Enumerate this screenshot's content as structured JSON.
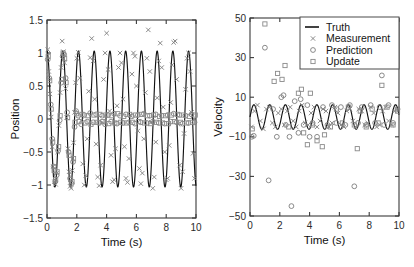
{
  "figure": {
    "background": "#ffffff",
    "truth_color": "#121212",
    "marker_color": "#7d7d7d"
  },
  "legend": {
    "position": "top-right-of-right-panel",
    "entries": [
      {
        "label": "Truth",
        "marker": "line"
      },
      {
        "label": "Measurement",
        "marker": "x"
      },
      {
        "label": "Prediction",
        "marker": "circle"
      },
      {
        "label": "Update",
        "marker": "square"
      }
    ]
  },
  "chart_data": [
    {
      "type": "line",
      "id": "position-panel",
      "title": "",
      "xlabel": "Time (s)",
      "ylabel": "Position",
      "xlim": [
        0,
        10
      ],
      "ylim": [
        -1.5,
        1.5
      ],
      "xticks": [
        0,
        2,
        4,
        6,
        8,
        10
      ],
      "yticks": [
        -1.5,
        -1,
        -0.5,
        0,
        0.5,
        1,
        1.5
      ],
      "xticklabels": [
        "0",
        "2",
        "4",
        "6",
        "8",
        "10"
      ],
      "yticklabels": [
        "-1.5",
        "-1",
        "-0.5",
        "0",
        "0.5",
        "1",
        "1.5"
      ],
      "grid": false,
      "series": [
        {
          "name": "Truth",
          "marker": "line",
          "type": "sinusoid",
          "amplitude": 1.03,
          "omega": 5.95,
          "phase": 1.5708,
          "samples": 900
        },
        {
          "name": "Measurement",
          "marker": "x",
          "x": [
            0.05,
            0.12,
            0.2,
            0.28,
            0.35,
            0.42,
            0.5,
            0.58,
            0.65,
            0.72,
            0.8,
            0.88,
            0.95,
            1.02,
            1.1,
            1.18,
            1.25,
            1.32,
            1.4,
            1.48,
            1.55,
            1.62,
            1.7,
            1.78,
            1.85,
            1.92,
            2.0,
            2.1,
            2.2,
            2.3,
            2.4,
            2.5,
            2.6,
            2.7,
            2.8,
            2.9,
            3.0,
            3.1,
            3.2,
            3.3,
            3.4,
            3.5,
            3.6,
            3.7,
            3.8,
            3.9,
            4.0,
            4.1,
            4.2,
            4.3,
            4.4,
            4.5,
            4.6,
            4.7,
            4.8,
            4.9,
            5.0,
            5.1,
            5.2,
            5.3,
            5.4,
            5.5,
            5.6,
            5.7,
            5.8,
            5.9,
            6.0,
            6.1,
            6.2,
            6.3,
            6.4,
            6.5,
            6.6,
            6.7,
            6.8,
            6.9,
            7.0,
            7.1,
            7.2,
            7.3,
            7.4,
            7.5,
            7.6,
            7.7,
            7.8,
            7.9,
            8.0,
            8.1,
            8.2,
            8.3,
            8.4,
            8.5,
            8.6,
            8.7,
            8.8,
            8.9,
            9.0,
            9.1,
            9.2,
            9.3,
            9.4,
            9.5,
            9.6,
            9.7,
            9.8,
            9.9
          ],
          "y": [
            1.05,
            0.72,
            0.38,
            0.03,
            -0.42,
            -0.72,
            -0.95,
            -0.99,
            -0.82,
            -0.5,
            -0.1,
            0.4,
            0.78,
            1.18,
            1.02,
            0.85,
            0.46,
            0.02,
            -0.45,
            -0.8,
            -1.02,
            -1.05,
            -0.78,
            -0.36,
            0.1,
            0.55,
            0.92,
            1.01,
            0.62,
            -0.02,
            -0.68,
            -1.0,
            -0.86,
            -0.3,
            0.42,
            0.93,
            1.22,
            0.88,
            0.3,
            -0.38,
            -0.88,
            -1.01,
            -0.7,
            -0.05,
            0.6,
            1.0,
            1.3,
            0.75,
            0.12,
            -0.55,
            -0.95,
            -0.92,
            -0.45,
            0.2,
            0.78,
            1.0,
            0.85,
            0.3,
            -0.42,
            -0.9,
            -0.96,
            -0.6,
            0.05,
            0.68,
            1.0,
            0.95,
            0.5,
            -0.18,
            -0.75,
            -0.98,
            -0.82,
            -0.3,
            0.4,
            0.92,
            1.35,
            0.72,
            -0.05,
            -1.05,
            -0.88,
            -0.35,
            0.32,
            0.88,
            1.15,
            0.78,
            0.18,
            -0.5,
            -0.92,
            -0.9,
            -0.4,
            0.25,
            0.82,
            1.16,
            1.18,
            0.6,
            -0.08,
            -0.7,
            -1.05,
            -0.8,
            -0.22,
            0.45,
            0.92,
            1.0,
            0.72,
            0.1,
            -0.52,
            -0.9,
            -0.78,
            -0.2,
            0.58
          ]
        },
        {
          "name": "Prediction",
          "marker": "circle",
          "x": [
            0.05,
            0.15,
            0.25,
            0.35,
            0.45,
            0.55,
            0.65,
            0.75,
            0.85,
            0.95,
            1.05,
            1.15,
            1.25,
            1.35,
            1.45,
            1.55,
            1.65,
            1.75,
            1.85,
            1.95,
            2.1,
            2.3,
            2.5,
            2.7,
            2.9,
            3.1,
            3.3,
            3.5,
            3.7,
            3.9,
            4.1,
            4.3,
            4.5,
            4.7,
            4.9,
            5.1,
            5.3,
            5.5,
            5.7,
            5.9,
            6.1,
            6.3,
            6.5,
            6.7,
            6.9,
            7.1,
            7.3,
            7.5,
            7.7,
            7.9,
            8.1,
            8.3,
            8.5,
            8.7,
            8.9,
            9.1,
            9.3,
            9.5,
            9.7,
            9.9
          ],
          "y": [
            0.9,
            0.62,
            0.22,
            -0.3,
            -0.72,
            -0.95,
            -0.85,
            -0.48,
            -0.02,
            0.55,
            0.95,
            0.98,
            0.62,
            0.1,
            -0.5,
            -0.9,
            -0.98,
            -0.65,
            -0.12,
            0.12,
            0.05,
            -0.08,
            0.06,
            -0.04,
            0.09,
            -0.05,
            0.07,
            -0.06,
            0.05,
            -0.08,
            0.06,
            -0.04,
            0.08,
            -0.07,
            0.05,
            -0.06,
            0.07,
            -0.05,
            0.04,
            -0.07,
            0.06,
            -0.05,
            0.08,
            -0.06,
            0.05,
            -0.04,
            0.07,
            -0.06,
            0.05,
            -0.07,
            0.06,
            -0.04,
            0.08,
            -0.05,
            0.06,
            -0.07,
            0.05,
            -0.06,
            0.07,
            -0.05
          ]
        },
        {
          "name": "Update",
          "marker": "square",
          "x": [
            0.08,
            0.18,
            0.28,
            0.38,
            0.48,
            0.58,
            0.68,
            0.78,
            0.88,
            0.98,
            1.08,
            1.18,
            1.28,
            1.38,
            1.48,
            1.58,
            1.68,
            1.78,
            1.88,
            1.98,
            2.15,
            2.35,
            2.55,
            2.75,
            2.95,
            3.15,
            3.35,
            3.55,
            3.75,
            3.95,
            4.15,
            4.35,
            4.55,
            4.75,
            4.95,
            5.15,
            5.35,
            5.55,
            5.75,
            5.95,
            6.15,
            6.35,
            6.55,
            6.75,
            6.95,
            7.15,
            7.35,
            7.55,
            7.75,
            7.95,
            8.15,
            8.35,
            8.55,
            8.75,
            8.95,
            9.15,
            9.35,
            9.55,
            9.75,
            9.95
          ],
          "y": [
            0.95,
            0.58,
            0.15,
            -0.35,
            -0.78,
            -0.92,
            -0.8,
            -0.42,
            0.05,
            0.6,
            1.0,
            0.92,
            0.55,
            0.02,
            -0.55,
            -0.92,
            -0.95,
            -0.6,
            -0.05,
            0.08,
            -0.04,
            0.07,
            -0.06,
            0.05,
            -0.08,
            0.06,
            -0.05,
            0.07,
            -0.04,
            0.06,
            -0.07,
            0.05,
            -0.06,
            0.08,
            -0.05,
            0.04,
            -0.06,
            0.07,
            -0.05,
            0.06,
            -0.04,
            0.07,
            -0.06,
            0.05,
            -0.07,
            0.06,
            -0.05,
            0.04,
            -0.06,
            0.05,
            -0.07,
            0.06,
            -0.04,
            0.07,
            -0.05,
            0.06,
            -0.06,
            0.04,
            -0.05,
            0.06
          ]
        }
      ]
    },
    {
      "type": "line",
      "id": "velocity-panel",
      "title": "",
      "xlabel": "Time (s)",
      "ylabel": "Velocity",
      "xlim": [
        0,
        10
      ],
      "ylim": [
        -50,
        50
      ],
      "xticks": [
        0,
        2,
        4,
        6,
        8,
        10
      ],
      "yticks": [
        -50,
        -30,
        -10,
        10,
        30,
        50
      ],
      "xticklabels": [
        "0",
        "2",
        "4",
        "6",
        "8",
        "10"
      ],
      "yticklabels": [
        "-50",
        "-30",
        "-10",
        "10",
        "30",
        "50"
      ],
      "grid": false,
      "series": [
        {
          "name": "Truth",
          "marker": "line",
          "type": "sinusoid",
          "amplitude": 6.2,
          "omega": 5.95,
          "phase": 0,
          "samples": 900
        },
        {
          "name": "Measurement",
          "marker": "x",
          "x": [
            0.1,
            0.3,
            0.5,
            0.7,
            0.9,
            1.1,
            1.3,
            1.5,
            1.7,
            1.9,
            2.1,
            2.3,
            2.5,
            2.7,
            2.9,
            3.1,
            3.3,
            3.5,
            3.7,
            3.9,
            4.1,
            4.3,
            4.5,
            4.7,
            4.9,
            5.1,
            5.3,
            5.5,
            5.7,
            5.9,
            6.1,
            6.3,
            6.5,
            6.7,
            6.9,
            7.1,
            7.3,
            7.5,
            7.7,
            7.9,
            8.1,
            8.3,
            8.5,
            8.7,
            8.9,
            9.1,
            9.3,
            9.5,
            9.7,
            9.9
          ],
          "y": [
            -5,
            3,
            6,
            -2,
            -6,
            4,
            5,
            -3,
            -5,
            2,
            4,
            -4,
            3,
            5,
            -2,
            -5,
            3,
            6,
            -3,
            -4,
            2,
            5,
            -5,
            -2,
            4,
            3,
            -5,
            -3,
            5,
            2,
            -4,
            -5,
            3,
            4,
            -2,
            -5,
            4,
            3,
            -4,
            -3,
            5,
            2,
            -5,
            -4,
            3,
            5,
            -2,
            -4,
            3,
            4
          ]
        },
        {
          "name": "Prediction",
          "marker": "circle",
          "x": [
            0.12,
            0.25,
            1.0,
            1.25,
            1.55,
            1.8,
            2.1,
            2.25,
            2.4,
            2.65,
            2.78,
            3.0,
            3.25,
            3.4,
            3.6,
            3.85,
            4.0,
            4.2,
            4.5,
            4.9,
            5.2,
            5.5,
            5.8,
            6.1,
            6.4,
            6.7,
            7.0,
            7.25,
            7.5,
            7.8,
            8.1,
            8.4,
            8.7,
            8.85,
            9.0,
            9.3,
            9.6,
            9.9
          ],
          "y": [
            -10,
            -9.5,
            35,
            -32,
            4,
            -10,
            10,
            11,
            -4,
            -10,
            -45,
            8,
            -8,
            9,
            -4,
            6,
            -10,
            -3,
            -10,
            5,
            -4,
            6,
            -3,
            5,
            -4,
            6,
            -35,
            -3,
            5,
            -4,
            6,
            -3,
            5,
            21,
            -4,
            6,
            -3,
            4
          ]
        },
        {
          "name": "Update",
          "marker": "square",
          "x": [
            0.15,
            1.0,
            1.62,
            1.85,
            2.15,
            2.35,
            2.6,
            3.25,
            3.45,
            3.6,
            3.85,
            4.05,
            4.2,
            4.5,
            4.85,
            5.0,
            5.4,
            5.8,
            6.2,
            6.6,
            7.0,
            7.2,
            7.4,
            7.8,
            8.2,
            8.6,
            8.85,
            9.2,
            9.6,
            9.9
          ],
          "y": [
            -6,
            47,
            18,
            22,
            19,
            26,
            -5,
            12,
            14,
            -8,
            -14,
            12,
            -4,
            -12,
            -15,
            -9,
            -5,
            4,
            -3,
            5,
            -4,
            -16,
            3,
            -5,
            4,
            -3,
            16,
            5,
            -4,
            3
          ]
        }
      ]
    }
  ]
}
